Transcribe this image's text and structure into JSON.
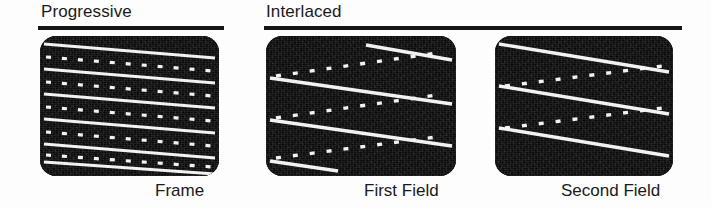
{
  "figure": {
    "background_color": "#fdfdfd",
    "panel_color": "#090909",
    "line_color": "#f2f2f2",
    "rule_color": "#151515",
    "text_color": "#1a1a1a"
  },
  "headings": [
    {
      "id": "progressive",
      "label": "Progressive",
      "rule": true
    },
    {
      "id": "interlaced",
      "label": "Interlaced",
      "rule": true
    }
  ],
  "captions": [
    {
      "id": "frame",
      "label": "Frame"
    },
    {
      "id": "first-field",
      "label": "First Field"
    },
    {
      "id": "second-field",
      "label": "Second Field"
    }
  ],
  "panels": [
    {
      "id": "progressive",
      "caption": "Frame",
      "heading": "Progressive",
      "scan_type": "progressive",
      "total_lines": 11,
      "solid_lines": 6,
      "dotted_lines": 5,
      "line_order": [
        "solid",
        "dotted",
        "solid",
        "dotted",
        "solid",
        "dotted",
        "solid",
        "dotted",
        "solid",
        "dotted",
        "solid"
      ],
      "description": "All lines of the frame drawn in sequence: solid and dotted lines alternate top to bottom."
    },
    {
      "id": "first-field",
      "caption": "First Field",
      "heading": "Interlaced",
      "scan_type": "interlaced-field-1",
      "total_lines": 8,
      "solid_lines": 4,
      "dotted_lines": 4,
      "line_order": [
        "solid",
        "dotted",
        "solid",
        "dotted",
        "solid",
        "dotted",
        "solid",
        "dotted"
      ],
      "description": "Only every other line is scanned; solid lines are offset and wrap, dotted lines sit between them."
    },
    {
      "id": "second-field",
      "caption": "Second Field",
      "scan_type": "interlaced-field-2",
      "heading": "Interlaced",
      "total_lines": 6,
      "solid_lines": 3,
      "dotted_lines": 3,
      "line_order": [
        "solid",
        "dotted",
        "solid",
        "dotted",
        "solid",
        "dotted"
      ],
      "description": "The complementary set of lines, filling the gaps left by the first field."
    }
  ]
}
